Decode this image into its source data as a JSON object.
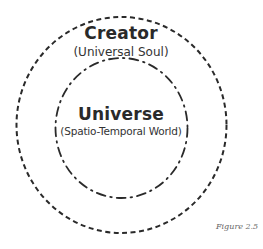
{
  "diagram": {
    "outer_circle": {
      "label": "Creator",
      "sublabel": "(Universal Soul)",
      "line_style": "dashed"
    },
    "inner_circle": {
      "label": "Universe",
      "sublabel": "(Spatio-Temporal World)",
      "line_style": "dash-dot"
    },
    "caption": "Figure 2.5",
    "colors": {
      "stroke": "#2a2a2a",
      "text": "#2a2a2a",
      "caption": "#666666",
      "background": "#ffffff"
    }
  }
}
